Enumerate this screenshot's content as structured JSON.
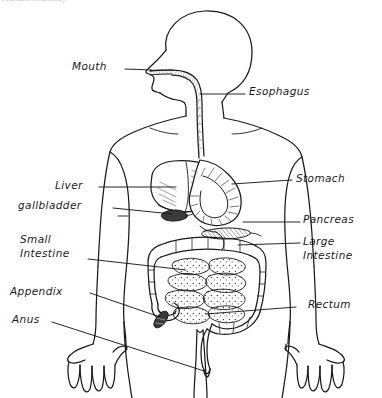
{
  "figure": {
    "title_partial": "Human Anatomy",
    "alt": "Hand-drawn diagram of the human digestive system inside a body outline",
    "width": 382,
    "height": 398,
    "background_color": "#ffffff",
    "ink_color": "#1a1a1a"
  },
  "labels": {
    "mouth": {
      "text": "Mouth",
      "side": "left"
    },
    "esophagus": {
      "text": "Esophagus",
      "side": "right"
    },
    "liver": {
      "text": "Liver",
      "side": "left"
    },
    "gallbladder": {
      "text": "gallbladder",
      "side": "left"
    },
    "stomach": {
      "text": "Stomach",
      "side": "right"
    },
    "pancreas": {
      "text": "Pancreas",
      "side": "right"
    },
    "small_intestine": {
      "line1": "Small",
      "line2": "Intestine",
      "side": "left"
    },
    "large_intestine": {
      "line1": "Large",
      "line2": "Intestine",
      "side": "right"
    },
    "appendix": {
      "text": "Appendix",
      "side": "left"
    },
    "anus": {
      "text": "Anus",
      "side": "left"
    },
    "rectum": {
      "text": "Rectum",
      "side": "right"
    }
  },
  "organs": [
    {
      "name": "mouth"
    },
    {
      "name": "esophagus"
    },
    {
      "name": "stomach"
    },
    {
      "name": "liver"
    },
    {
      "name": "gallbladder"
    },
    {
      "name": "pancreas"
    },
    {
      "name": "small-intestine"
    },
    {
      "name": "large-intestine"
    },
    {
      "name": "appendix"
    },
    {
      "name": "rectum"
    },
    {
      "name": "anus"
    }
  ]
}
